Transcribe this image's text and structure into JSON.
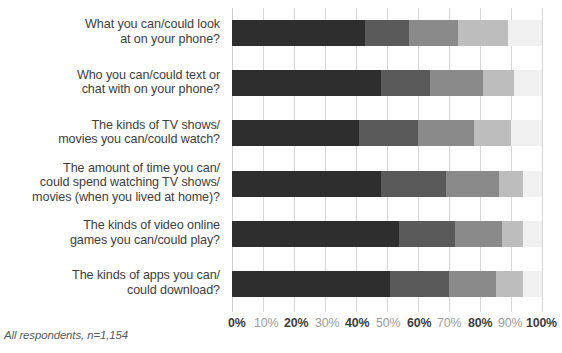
{
  "footnote": "All respondents, n=1,154",
  "chart_data": {
    "type": "bar",
    "orientation": "horizontal",
    "stacked": true,
    "stacked_mode": "percent",
    "title": "",
    "subtitle": "",
    "xlabel": "",
    "ylabel": "",
    "xlim": [
      0,
      100
    ],
    "grid": true,
    "grid_axis": "x",
    "legend": "none",
    "note": "All respondents, n=1,154",
    "xticks": [
      0,
      10,
      20,
      30,
      40,
      50,
      60,
      70,
      80,
      90,
      100
    ],
    "xticklabels": [
      "0%",
      "10%",
      "20%",
      "30%",
      "40%",
      "50%",
      "60%",
      "70%",
      "80%",
      "90%",
      "100%"
    ],
    "categories": [
      "What you can/could look at on your phone?",
      "Who you can/could text or chat with on your phone?",
      "The kinds of TV shows/ movies you can/could watch?",
      "The amount of time you can/ could spend watching TV shows/ movies (when you lived at home)?",
      "The kinds of video online games you can/could play?",
      "The kinds of apps you can/ could download?"
    ],
    "category_lines": [
      [
        "What you can/could look",
        "at on your phone?"
      ],
      [
        "Who you can/could text or",
        "chat with on your phone?"
      ],
      [
        "The kinds of TV shows/",
        "movies you can/could watch?"
      ],
      [
        "The amount of time you can/",
        "could spend watching TV shows/",
        "movies (when you lived at home)?"
      ],
      [
        "The kinds of video online",
        "games you can/could play?"
      ],
      [
        "The kinds of apps you can/",
        "could download?"
      ]
    ],
    "series": [
      {
        "name": "Segment 1",
        "color": "#2e2e2e",
        "values": [
          43,
          48,
          41,
          48,
          54,
          51
        ]
      },
      {
        "name": "Segment 2",
        "color": "#5a5a5a",
        "values": [
          14,
          16,
          19,
          21,
          18,
          19
        ]
      },
      {
        "name": "Segment 3",
        "color": "#8a8a8a",
        "values": [
          16,
          17,
          18,
          17,
          15,
          15
        ]
      },
      {
        "name": "Segment 4",
        "color": "#bdbdbd",
        "values": [
          16,
          10,
          12,
          8,
          7,
          9
        ]
      },
      {
        "name": "Segment 5",
        "color": "#f0f0f0",
        "values": [
          11,
          9,
          10,
          6,
          6,
          6
        ]
      }
    ]
  }
}
